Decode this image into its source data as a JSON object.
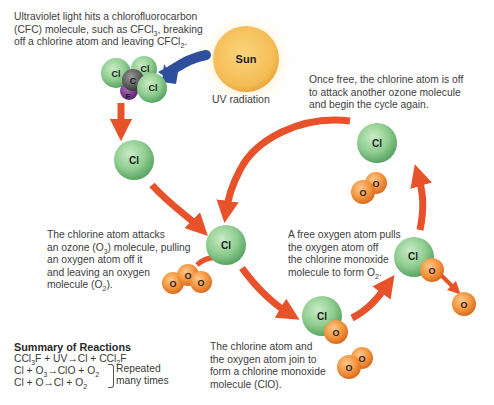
{
  "captions": {
    "uv_hits": {
      "line1": "Ultraviolet light hits a chlorofluorocarbon",
      "line2_a": "(CFC) molecule, such as CFCl",
      "line2_sub": "3",
      "line2_b": ", breaking",
      "line3_a": "off a chlorine atom and leaving CFCl",
      "line3_sub": "2",
      "line3_b": "."
    },
    "once_free": {
      "line1": "Once free, the chlorine atom is off",
      "line2": "to attack another ozone molecule",
      "line3": "and begin the cycle again."
    },
    "attacks": {
      "line1": "The chlorine atom attacks",
      "line2_a": "an ozone (O",
      "line2_sub": "3",
      "line2_b": ") molecule, pulling",
      "line3": "an oxygen atom off it",
      "line4": "and leaving an oxygen",
      "line5_a": "molecule (O",
      "line5_sub": "2",
      "line5_b": ")."
    },
    "free_oxygen": {
      "line1": "A free oxygen atom pulls",
      "line2": "the oxygen atom off",
      "line3": "the chlorine monoxide",
      "line4_a": "molecule to form O",
      "line4_sub": "2",
      "line4_b": "."
    },
    "join": {
      "line1": "The chlorine atom and",
      "line2": "the oxygen atom join to",
      "line3": "form a chlorine monoxide",
      "line4": "molecule (ClO)."
    }
  },
  "sun": {
    "label": "Sun",
    "radiation_label": "UV radiation"
  },
  "atoms": {
    "cl": "Cl",
    "c": "C",
    "f": "F",
    "o": "O"
  },
  "summary": {
    "title": "Summary of Reactions",
    "r1_a": "CCl",
    "r1_sub1": "3",
    "r1_b": "F + UV",
    "r1_c": "Cl + CCl",
    "r1_sub2": "2",
    "r1_d": "F",
    "r2_a": "Cl + O",
    "r2_sub1": "3",
    "r2_b": "ClO + O",
    "r2_sub2": "2",
    "r3_a": "Cl + O",
    "r3_b": "Cl + O",
    "r3_sub": "2",
    "arrow": "→",
    "note_line1": "Repeated",
    "note_line2": "many times"
  },
  "colors": {
    "arrow": "#e8522a",
    "uv_arrow": "#2e4f9c",
    "chlorine": "#8ccc8e",
    "oxygen": "#f0933f",
    "carbon": "#5a5a5a",
    "fluorine": "#7b3a8c",
    "sun": "#f6c25c"
  }
}
